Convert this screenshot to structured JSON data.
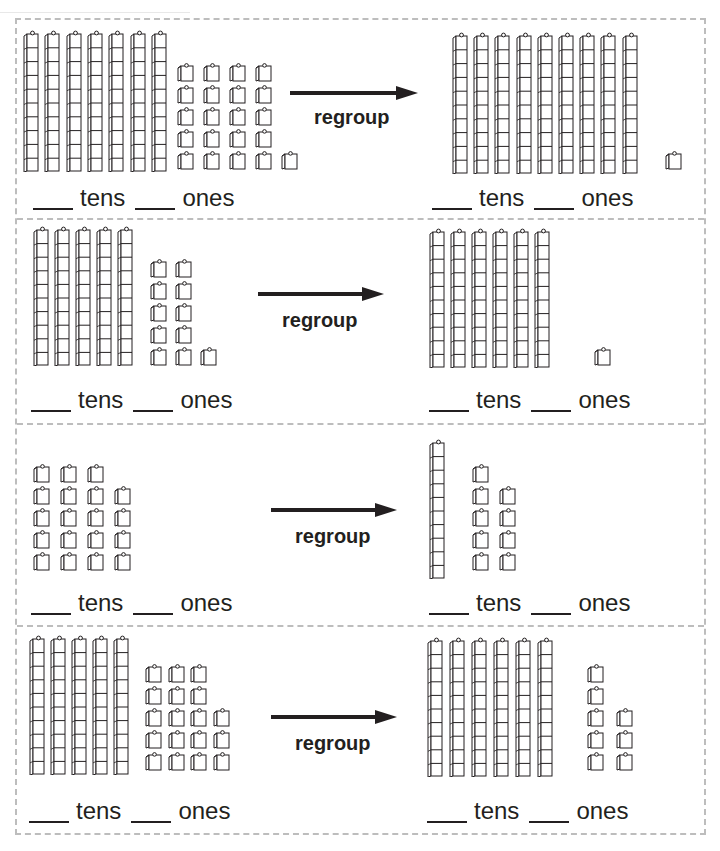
{
  "worksheet": {
    "heading_cropped": "regroup",
    "rows": [
      {
        "left": {
          "tens": 7,
          "ones": 21,
          "ones_columns": [
            5,
            5,
            5,
            5,
            1
          ]
        },
        "right": {
          "tens": 9,
          "ones": 1,
          "ones_columns": [
            1
          ]
        },
        "action_label": "regroup",
        "tens_label": "tens",
        "ones_label": "ones"
      },
      {
        "left": {
          "tens": 5,
          "ones": 11,
          "ones_columns": [
            5,
            5,
            1
          ]
        },
        "right": {
          "tens": 6,
          "ones": 1,
          "ones_columns": [
            1
          ]
        },
        "action_label": "regroup",
        "tens_label": "tens",
        "ones_label": "ones"
      },
      {
        "left": {
          "tens": 0,
          "ones": 19,
          "ones_columns": [
            5,
            5,
            5,
            4
          ]
        },
        "right": {
          "tens": 1,
          "ones": 9,
          "ones_columns": [
            5,
            4
          ]
        },
        "action_label": "regroup",
        "tens_label": "tens",
        "ones_label": "ones"
      },
      {
        "left": {
          "tens": 5,
          "ones": 18,
          "ones_columns": [
            5,
            5,
            5,
            3
          ]
        },
        "right": {
          "tens": 6,
          "ones": 8,
          "ones_columns": [
            5,
            3
          ]
        },
        "action_label": "regroup",
        "tens_label": "tens",
        "ones_label": "ones"
      }
    ]
  },
  "colors": {
    "ink": "#231f20",
    "dashed_border": "#bdbdbd",
    "background": "#ffffff"
  }
}
